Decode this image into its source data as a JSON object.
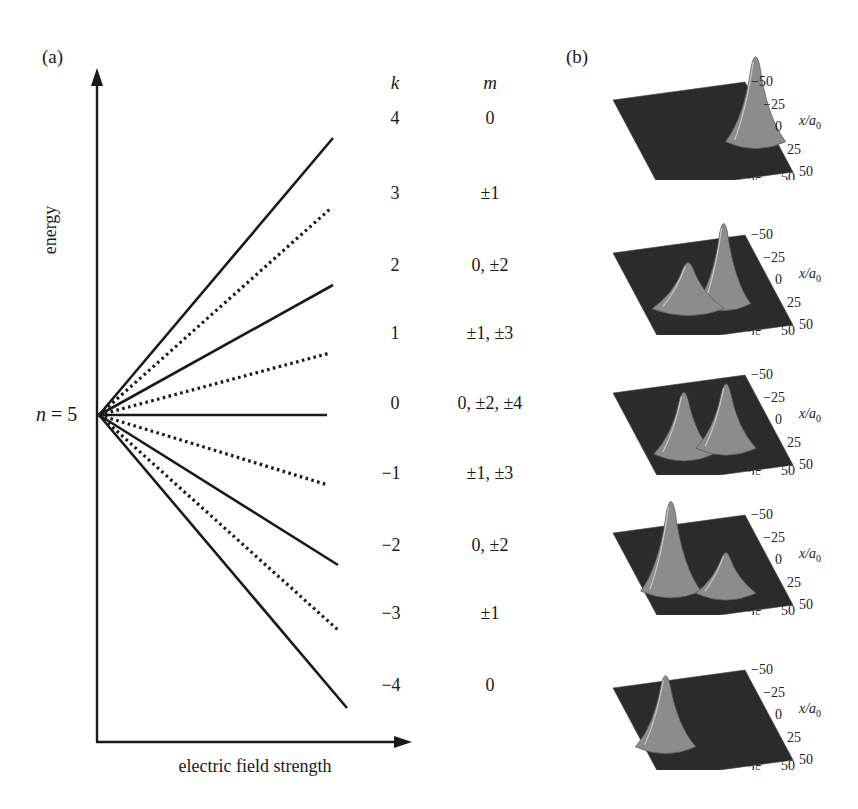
{
  "panel_a": {
    "label": "(a)",
    "y_axis_label": "energy",
    "x_axis_label": "electric field strength",
    "level_label_n": "n",
    "level_label_eq": " = ",
    "level_label_value": "5",
    "column_headers": {
      "k": "k",
      "m": "m"
    },
    "levels": [
      {
        "k": "4",
        "m": "0",
        "style": "solid",
        "end": [
          333,
          138
        ]
      },
      {
        "k": "3",
        "m": "±1",
        "style": "dotted",
        "end": [
          330,
          209
        ]
      },
      {
        "k": "2",
        "m": "0, ±2",
        "style": "solid",
        "end": [
          333,
          285
        ]
      },
      {
        "k": "1",
        "m": "±1, ±3",
        "style": "dotted",
        "end": [
          330,
          353
        ]
      },
      {
        "k": "0",
        "m": "0, ±2, ±4",
        "style": "solid",
        "end": [
          327,
          415
        ]
      },
      {
        "k": "−1",
        "m": "±1, ±3",
        "style": "dotted",
        "end": [
          328,
          485
        ]
      },
      {
        "k": "−2",
        "m": "0, ±2",
        "style": "solid",
        "end": [
          338,
          565
        ]
      },
      {
        "k": "−3",
        "m": "±1",
        "style": "dotted",
        "end": [
          338,
          630
        ]
      },
      {
        "k": "−4",
        "m": "0",
        "style": "solid",
        "end": [
          347,
          708
        ]
      }
    ]
  },
  "panel_b": {
    "label": "(b)",
    "x_axis_ticks": [
      "−50",
      "−25",
      "0",
      "25",
      "50"
    ],
    "x_axis_label": "x/a",
    "x_axis_sub": "0",
    "z_axis_ticks": [
      "−50",
      "−25",
      "0",
      "25",
      "50"
    ],
    "z_axis_label": "z/a",
    "z_axis_sub": "0",
    "plots": [
      {
        "k": "4",
        "description": "single peak at positive z"
      },
      {
        "k": "2",
        "description": "main peak near z≈0 with side lobes"
      },
      {
        "k": "0",
        "description": "two symmetric peaks"
      },
      {
        "k": "−2",
        "description": "main peak at negative z with side lobes"
      },
      {
        "k": "−4",
        "description": "single peak at negative z"
      }
    ]
  },
  "colors": {
    "ink": "#1a1a1a",
    "surface_dark": "#2b2b2b",
    "surface_light": "#9a9a9a"
  }
}
